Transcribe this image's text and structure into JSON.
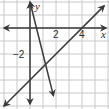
{
  "graph": {
    "origin_px": [
      30,
      28
    ],
    "unit_px": 13,
    "grid": {
      "x_range": [
        -2,
        6
      ],
      "y_range": [
        -6,
        2
      ],
      "color": "#c8c8c8"
    },
    "axis_color": "#3a3a3a",
    "line_color": "#3a3a3a",
    "labels": {
      "x_axis": "x",
      "y_axis": "y",
      "tick_x_2": "2",
      "tick_x_4": "4",
      "tick_y_neg2": "−2"
    },
    "lines": [
      {
        "name": "rising-line",
        "equation": "y = x - 4",
        "slope": 1,
        "intercept": -4
      },
      {
        "name": "steep-falling-line",
        "equation": "y = -4x + 2",
        "slope": -4,
        "intercept": 2
      }
    ],
    "intersection": {
      "x": 1.2,
      "y": -2.8
    }
  }
}
